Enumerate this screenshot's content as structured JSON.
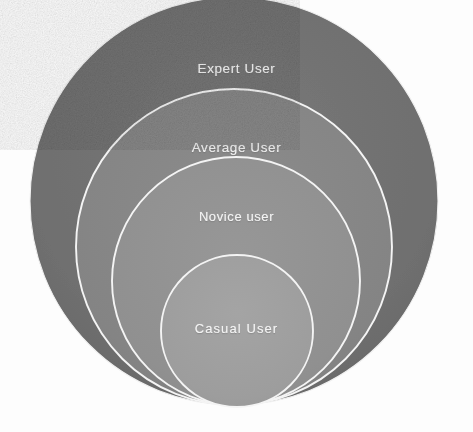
{
  "diagram": {
    "type": "nested-circles",
    "background_color": "#fdfdfd",
    "stroke_color": "#f5f5f5",
    "label_color": "#f2f2f2",
    "levels": [
      {
        "id": "expert",
        "label": "Expert User",
        "order": 1,
        "fill": "#707070",
        "cx": 234,
        "cy": 201,
        "r": 204
      },
      {
        "id": "average",
        "label": "Average User",
        "order": 2,
        "fill": "#858585",
        "cx": 234,
        "cy": 247,
        "r": 158
      },
      {
        "id": "novice",
        "label": "Novice user",
        "order": 3,
        "fill": "#919191",
        "cx": 236,
        "cy": 281,
        "r": 124
      },
      {
        "id": "casual",
        "label": "Casual  User",
        "order": 4,
        "fill": "#9d9d9d",
        "cx": 237,
        "cy": 331,
        "r": 76
      }
    ]
  }
}
